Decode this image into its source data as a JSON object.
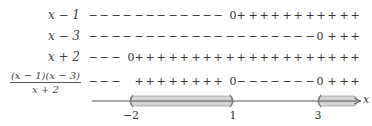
{
  "rows": [
    {
      "label": "x − 1",
      "zero_at": 1
    },
    {
      "label": "x − 3",
      "zero_at": 3
    },
    {
      "label": "x + 2",
      "zero_at": -2
    }
  ],
  "quotient": {
    "numerator": "(x − 1)(x − 3)",
    "denominator": "x + 2"
  },
  "axis": {
    "variable": "x",
    "ticks": [
      {
        "value": -2,
        "label": "−2"
      },
      {
        "value": 1,
        "label": "1"
      },
      {
        "value": 3,
        "label": "3"
      }
    ]
  },
  "solution_intervals": [
    "(-2, 1)",
    "(3, ∞)"
  ],
  "colors": {
    "shade": "#d4d4d4",
    "shade_edge": "#a8a8a8",
    "line": "#555555"
  }
}
